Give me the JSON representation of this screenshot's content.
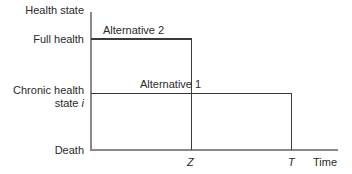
{
  "diagram": {
    "y_axis": {
      "title": "Health state",
      "levels": {
        "full_health": "Full health",
        "chronic_line1": "Chronic health",
        "chronic_line2": "state ",
        "chronic_var": "i",
        "death": "Death"
      }
    },
    "x_axis": {
      "title": "Time",
      "ticks": {
        "z": "Z",
        "t": "T"
      }
    },
    "series": [
      {
        "name": "Alternative 2",
        "level": "Full health",
        "end": "Z"
      },
      {
        "name": "Alternative 1",
        "level": "Chronic health state i",
        "end": "T"
      }
    ],
    "labels": {
      "alt2": "Alternative 2",
      "alt1": "Alternative 1"
    }
  }
}
